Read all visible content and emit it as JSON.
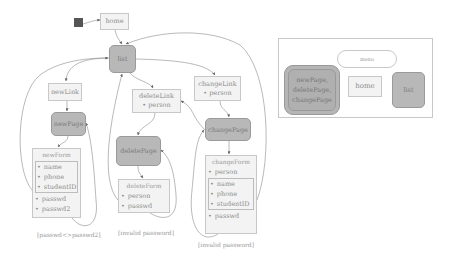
{
  "diagram": {
    "type": "state-machine",
    "colors": {
      "page_state_fill": "#b8b8b8",
      "link_state_fill": "#f3f3f3",
      "border": "#c8c8c8",
      "edge": "#8a8a8a",
      "initial": "#555555"
    },
    "nodes": {
      "home": {
        "label": "home"
      },
      "list": {
        "label": "list"
      },
      "newLink": {
        "label": "newLink"
      },
      "newPage": {
        "label": "newPage"
      },
      "deleteLink": {
        "label": "deleteLink",
        "params": [
          "person"
        ]
      },
      "deletePage": {
        "label": "deletePage"
      },
      "changeLink": {
        "label": "changeLink",
        "params": [
          "person"
        ]
      },
      "changePage": {
        "label": "changePage"
      },
      "newForm": {
        "title": "newForm",
        "grouped_fields": [
          "name",
          "phone",
          "studentID"
        ],
        "fields": [
          "passwd",
          "passwd2"
        ]
      },
      "deleteForm": {
        "title": "deleteForm",
        "fields": [
          "person",
          "passwd"
        ]
      },
      "changeForm": {
        "title": "changeForm",
        "pre_fields": [
          "person"
        ],
        "grouped_fields": [
          "name",
          "phone",
          "studentID"
        ],
        "fields": [
          "passwd"
        ]
      }
    },
    "guards": {
      "newForm": "[passwd<>passwd2]",
      "deleteForm": "[invalid password]",
      "changeForm": "[invalid password]"
    },
    "edges": [
      {
        "from": "initial",
        "to": "home"
      },
      {
        "from": "home",
        "to": "list"
      },
      {
        "from": "list",
        "to": "newLink"
      },
      {
        "from": "list",
        "to": "deleteLink"
      },
      {
        "from": "list",
        "to": "changeLink"
      },
      {
        "from": "newLink",
        "to": "newPage"
      },
      {
        "from": "newPage",
        "to": "newForm"
      },
      {
        "from": "newForm",
        "to": "newPage",
        "guard": "[passwd<>passwd2]"
      },
      {
        "from": "newForm",
        "to": "list"
      },
      {
        "from": "deleteLink",
        "to": "deletePage"
      },
      {
        "from": "deletePage",
        "to": "deleteForm"
      },
      {
        "from": "deleteForm",
        "to": "deletePage",
        "guard": "[invalid password]"
      },
      {
        "from": "deleteForm",
        "to": "list"
      },
      {
        "from": "changeLink",
        "to": "changePage"
      },
      {
        "from": "changePage",
        "to": "changeForm"
      },
      {
        "from": "changeForm",
        "to": "changePage",
        "guard": "[invalid password]"
      },
      {
        "from": "changeForm",
        "to": "list"
      }
    ],
    "legend": {
      "menu_label": "menu",
      "group_label_lines": [
        "newPage,",
        "deletePage,",
        "changePage"
      ],
      "home_label": "home",
      "list_label": "list"
    }
  }
}
